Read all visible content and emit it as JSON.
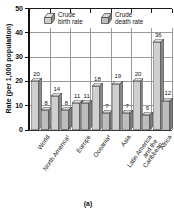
{
  "chart_data": {
    "type": "bar",
    "title": "",
    "ylabel": "Rate (per 1,000 population)",
    "xlabel": "",
    "caption": "(a)",
    "ylim": [
      0,
      50
    ],
    "yticks": [
      0,
      10,
      20,
      30,
      40,
      50
    ],
    "grid": true,
    "legend_position": "top-inside",
    "bar_style": "3d",
    "categories": [
      "World",
      "North America¹",
      "Europe",
      "Oceania²",
      "Asia",
      "Latin America\nand the\nCaribbean",
      "Africa"
    ],
    "series": [
      {
        "name": "Crude birth rate",
        "values": [
          20,
          14,
          11,
          18,
          19,
          20,
          36
        ],
        "front_color": "#cfcfcf",
        "top_color": "#e3e3e3",
        "side_color": "#8d8d8d"
      },
      {
        "name": "Crude death rate",
        "values": [
          8,
          8,
          11,
          7,
          7,
          6,
          12
        ],
        "front_color": "#bdbdbd",
        "top_color": "#d8d8d8",
        "side_color": "#7e7e7e"
      }
    ],
    "line_color": "#1c1c1c",
    "grid_color": "#9a9a9a",
    "text_color": "#111111"
  }
}
